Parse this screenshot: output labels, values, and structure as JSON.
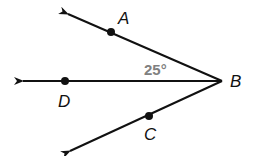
{
  "diagram": {
    "type": "angle-rays",
    "vertex": {
      "label": "B",
      "x": 222,
      "y": 81
    },
    "rays": [
      {
        "name": "BA",
        "point_label": "A",
        "point": [
          111,
          32
        ],
        "tip": [
          66,
          13
        ]
      },
      {
        "name": "BD",
        "point_label": "D",
        "point": [
          65,
          81
        ],
        "tip": [
          21,
          81
        ]
      },
      {
        "name": "BC",
        "point_label": "C",
        "point": [
          149,
          116
        ],
        "tip": [
          68,
          152
        ]
      }
    ],
    "angle_label": "25°",
    "angle_between": [
      "BA",
      "BD"
    ],
    "labels": {
      "A": "A",
      "B": "B",
      "C": "C",
      "D": "D"
    },
    "colors": {
      "line": "#111111",
      "angle_text": "#808080"
    }
  }
}
